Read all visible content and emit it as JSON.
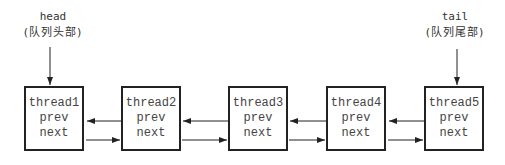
{
  "diagram": {
    "type": "doubly-linked-list",
    "head_label": {
      "name": "head",
      "description": "(队列头部)"
    },
    "tail_label": {
      "name": "tail",
      "description": "(队列尾部)"
    },
    "nodes": [
      {
        "name": "thread1",
        "prev": "prev",
        "next": "next"
      },
      {
        "name": "thread2",
        "prev": "prev",
        "next": "next"
      },
      {
        "name": "thread3",
        "prev": "prev",
        "next": "next"
      },
      {
        "name": "thread4",
        "prev": "prev",
        "next": "next"
      },
      {
        "name": "thread5",
        "prev": "prev",
        "next": "next"
      }
    ],
    "edges": [
      {
        "from": "head",
        "to": "thread1"
      },
      {
        "from": "tail",
        "to": "thread5"
      },
      {
        "from": "thread1",
        "to": "thread2",
        "field": "next"
      },
      {
        "from": "thread2",
        "to": "thread1",
        "field": "prev"
      },
      {
        "from": "thread2",
        "to": "thread3",
        "field": "next"
      },
      {
        "from": "thread3",
        "to": "thread2",
        "field": "prev"
      },
      {
        "from": "thread3",
        "to": "thread4",
        "field": "next"
      },
      {
        "from": "thread4",
        "to": "thread3",
        "field": "prev"
      },
      {
        "from": "thread4",
        "to": "thread5",
        "field": "next"
      },
      {
        "from": "thread5",
        "to": "thread4",
        "field": "prev"
      }
    ],
    "colors": {
      "stroke": "#222222",
      "text": "#444444",
      "background": "#ffffff"
    }
  }
}
